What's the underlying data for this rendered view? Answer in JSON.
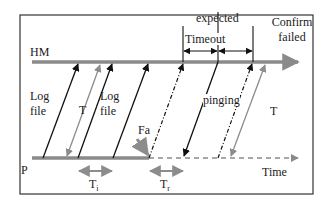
{
  "diagram": {
    "lanes": {
      "top": "HM",
      "bottom": "P"
    },
    "labels": {
      "expected": "expected",
      "confirm_failed_line1": "Confirm",
      "confirm_failed_line2": "failed",
      "timeout": "Timeout",
      "log_file_1_line1": "Log",
      "log_file_1_line2": "file",
      "log_file_2_line1": "Log",
      "log_file_2_line2": "file",
      "period_T_left": "T",
      "period_T_right": "T",
      "pinging": "pinging",
      "failure": "Fa",
      "interval_i": "T",
      "interval_i_sub": "i",
      "interval_r": "T",
      "interval_r_sub": "r",
      "time_axis": "Time"
    },
    "colors": {
      "lane_line": "#8a8a8a",
      "black_arrow": "#111111",
      "gray_arrow": "#8c8c8c",
      "frame": "#333333"
    }
  }
}
